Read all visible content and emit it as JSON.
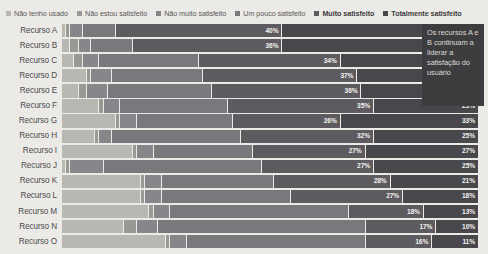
{
  "legend": {
    "items": [
      {
        "label": "Não tenho usado",
        "color": "#b9b7b2",
        "bold": false
      },
      {
        "label": "Não estou satisfeito",
        "color": "#9a9894",
        "bold": false
      },
      {
        "label": "Não muito satisfeito",
        "color": "#88868a",
        "bold": false
      },
      {
        "label": "Um pouco satisfeito",
        "color": "#7a787c",
        "bold": false
      },
      {
        "label": "Muito satisfeito",
        "color": "#5d5b60",
        "bold": true
      },
      {
        "label": "Totalmente satisfeito",
        "color": "#48474b",
        "bold": true
      }
    ]
  },
  "callout": {
    "text": "Os recursos A e B continuam a liderar a satisfação do usuário",
    "background": "#3d3c3e",
    "text_color": "#dedcd8"
  },
  "chart_data": {
    "type": "bar",
    "subtype": "stacked-horizontal-100-percent",
    "title": "",
    "xlabel": "",
    "ylabel": "",
    "xlim": [
      0,
      100
    ],
    "grid": false,
    "legend_position": "top",
    "categories": [
      "Recurso A",
      "Recurso B",
      "Recurso C",
      "Recurso D",
      "Recurso E",
      "Recurso F",
      "Recurso G",
      "Recurso H",
      "Recurso I",
      "Recurso J",
      "Recurso K",
      "Recurso L",
      "Recurso M",
      "Recurso N",
      "Recurso O"
    ],
    "series": [
      {
        "name": "Não tenho usado",
        "color": "#b9b7b2",
        "values": [
          1,
          2,
          3,
          6,
          4,
          9,
          13,
          8,
          17,
          1,
          19,
          19,
          21,
          15,
          25
        ]
      },
      {
        "name": "Não estou satisfeito",
        "color": "#9a9894",
        "values": [
          1,
          2,
          2,
          1,
          2,
          1,
          1,
          1,
          1,
          1,
          1,
          1,
          1,
          3,
          1
        ]
      },
      {
        "name": "Não muito satisfeito",
        "color": "#88868a",
        "values": [
          3,
          3,
          4,
          5,
          5,
          4,
          4,
          3,
          4,
          8,
          4,
          4,
          4,
          5,
          4
        ]
      },
      {
        "name": "Um pouco satisfeito",
        "color": "#7a787c",
        "values": [
          8,
          10,
          24,
          22,
          25,
          26,
          23,
          31,
          24,
          38,
          27,
          31,
          43,
          50,
          43
        ]
      },
      {
        "name": "Muito satisfeito",
        "color": "#5d5b60",
        "values": [
          40,
          36,
          34,
          37,
          36,
          35,
          26,
          32,
          27,
          27,
          28,
          27,
          18,
          17,
          16
        ]
      },
      {
        "name": "Totalmente satisfeito",
        "color": "#48474b",
        "values": [
          47,
          47,
          33,
          29,
          28,
          25,
          33,
          25,
          27,
          25,
          21,
          18,
          13,
          10,
          11
        ]
      }
    ],
    "labeled_values": {
      "Muito satisfeito": [
        "40%",
        "36%",
        "34%",
        "37%",
        "36%",
        "35%",
        "26%",
        "32%",
        "27%",
        "27%",
        "28%",
        "27%",
        "18%",
        "17%",
        "16%"
      ],
      "Totalmente satisfeito": [
        "47%",
        "47%",
        "33%",
        "29%",
        "28%",
        "25%",
        "33%",
        "25%",
        "27%",
        "25%",
        "21%",
        "18%",
        "13%",
        "10%",
        "11%"
      ]
    }
  }
}
